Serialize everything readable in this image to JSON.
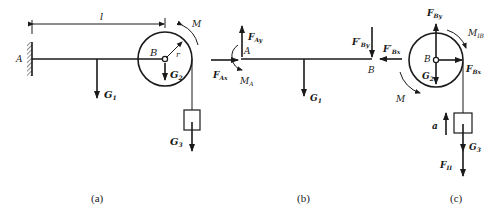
{
  "figure": {
    "panels": [
      {
        "id": "a",
        "caption": "(a)",
        "labels": {
          "support": "A",
          "pulley": "B",
          "length": "l",
          "radius": "r",
          "moment": "M",
          "beam_weight": "G",
          "beam_weight_sub": "1",
          "pulley_weight": "G",
          "pulley_weight_sub": "2",
          "block_weight": "G",
          "block_weight_sub": "3"
        }
      },
      {
        "id": "b",
        "caption": "(b)",
        "labels": {
          "end_a": "A",
          "end_b": "B",
          "fax": "F",
          "fax_sub": "Ax",
          "fay": "F",
          "fay_sub": "Ay",
          "ma": "M",
          "ma_sub": "A",
          "fby_prime": "F′",
          "fby_prime_sub": "By",
          "g1": "G",
          "g1_sub": "1"
        }
      },
      {
        "id": "c",
        "caption": "(c)",
        "labels": {
          "center": "B",
          "fbx_prime": "F′",
          "fbx_prime_sub": "Bx",
          "fby": "F",
          "fby_sub": "By",
          "fbx": "F",
          "fbx_sub": "Bx",
          "mib": "M",
          "mib_sub": "IB",
          "g2": "G",
          "g2_sub": "2",
          "m": "M",
          "accel": "a",
          "g3": "G",
          "g3_sub": "3",
          "fi": "F",
          "fi_sub": "II"
        }
      }
    ]
  }
}
